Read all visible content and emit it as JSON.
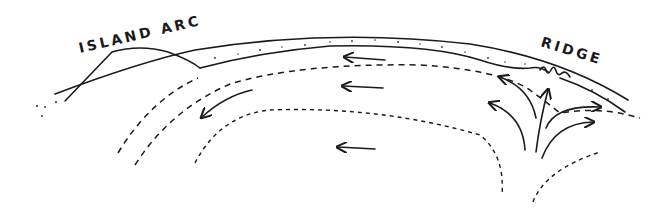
{
  "figure": {
    "type": "cross-section diagram",
    "labels": {
      "island_arc": "ISLAND ARC",
      "ridge": "RIDGE"
    },
    "colors": {
      "ink": "#1a1a1a",
      "background": "#ffffff",
      "stipple": "#333333"
    },
    "elements": {
      "lithosphere_plate": "stippled curved plate from island arc to ridge",
      "subducting_slab": "plate descending beneath island arc (left)",
      "upwelling": "rising flow arrows beneath ridge (right)",
      "return_flow": "leftward arrows in the mantle",
      "flow_boundaries": "dashed convection cell boundaries"
    },
    "arrows": [
      {
        "id": "upper-left-flow",
        "direction": "left"
      },
      {
        "id": "middle-left-flow",
        "direction": "left"
      },
      {
        "id": "lower-left-flow",
        "direction": "left"
      },
      {
        "id": "downwelling-flow",
        "direction": "down-left"
      },
      {
        "id": "ridge-upwelling-center",
        "direction": "up"
      },
      {
        "id": "ridge-spread-left-upper",
        "direction": "up-left"
      },
      {
        "id": "ridge-spread-left-lower",
        "direction": "up-left"
      },
      {
        "id": "ridge-spread-right-upper",
        "direction": "up-right"
      },
      {
        "id": "ridge-spread-right-lower",
        "direction": "right"
      }
    ]
  }
}
